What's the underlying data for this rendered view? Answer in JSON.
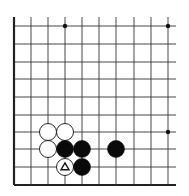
{
  "board": {
    "type": "go-board-partial",
    "view": "lower-left corner",
    "columns_x": [
      14,
      31,
      48,
      65,
      82,
      99,
      116,
      134,
      151,
      168
    ],
    "rows_y": [
      26,
      44,
      62,
      79,
      97,
      115,
      132,
      149,
      167,
      185
    ],
    "right_extent": 176,
    "top_extent": 17,
    "left_edge_thick": true,
    "bottom_edge_thick": true,
    "line_color": "#333333",
    "edge_color": "#222222",
    "star_points": [
      {
        "col": 3,
        "row": 0
      },
      {
        "col": 9,
        "row": 0
      },
      {
        "col": 9,
        "row": 6
      }
    ],
    "stones": [
      {
        "color": "white",
        "col": 2,
        "row": 6
      },
      {
        "color": "white",
        "col": 3,
        "row": 6
      },
      {
        "color": "white",
        "col": 2,
        "row": 7
      },
      {
        "color": "black",
        "col": 3,
        "row": 7
      },
      {
        "color": "black",
        "col": 4,
        "row": 7
      },
      {
        "color": "black",
        "col": 6,
        "row": 7
      },
      {
        "color": "white",
        "col": 3,
        "row": 8,
        "marker": "triangle"
      },
      {
        "color": "black",
        "col": 4,
        "row": 8
      }
    ],
    "stone_radius": 8.5
  }
}
